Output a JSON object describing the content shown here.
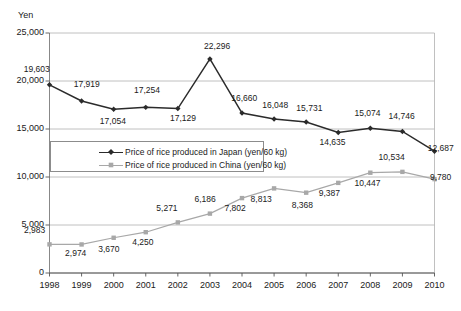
{
  "chart_data": {
    "type": "line",
    "title": "",
    "xlabel": "",
    "ylabel": "Yen",
    "ylim": [
      0,
      25000
    ],
    "ytick_labels": [
      "25,000",
      "20,000",
      "15,000",
      "10,000",
      "5,000",
      "0"
    ],
    "ytick_values": [
      25000,
      20000,
      15000,
      10000,
      5000,
      0
    ],
    "grid": true,
    "legend_position": "inside-upper-left",
    "categories": [
      "1998",
      "1999",
      "2000",
      "2001",
      "2002",
      "2003",
      "2004",
      "2005",
      "2006",
      "2007",
      "2008",
      "2009",
      "2010"
    ],
    "x": [
      1998,
      1999,
      2000,
      2001,
      2002,
      2003,
      2004,
      2005,
      2006,
      2007,
      2008,
      2009,
      2010
    ],
    "series": [
      {
        "name": "Price of rice produced in Japan (yen/60 kg)",
        "color": "#2b2b2b",
        "marker": "filled-diamond",
        "values": [
          19603,
          17919,
          17054,
          17254,
          17129,
          22296,
          16660,
          16048,
          15731,
          14635,
          15074,
          14746,
          12687
        ],
        "labels": [
          "19,603",
          "17,919",
          "17,054",
          "17,254",
          "17,129",
          "22,296",
          "16,660",
          "16,048",
          "15,731",
          "14,635",
          "15,074",
          "14,746",
          "12,687"
        ]
      },
      {
        "name": "Price of rice produced in China (yen/60 kg)",
        "color": "#a8a8a8",
        "marker": "filled-square",
        "values": [
          2983,
          2974,
          3670,
          4250,
          5271,
          6186,
          7802,
          8813,
          8368,
          9387,
          10447,
          10534,
          9780
        ],
        "labels": [
          "2,983",
          "2,974",
          "3,670",
          "4,250",
          "5,271",
          "6,186",
          "7,802",
          "8,813",
          "8,368",
          "9,387",
          "10,447",
          "10,534",
          "9,780"
        ]
      }
    ],
    "label_offsets": {
      "japan": [
        {
          "dx": -12,
          "dy": -16
        },
        {
          "dx": 6,
          "dy": -17
        },
        {
          "dx": 0,
          "dy": 12
        },
        {
          "dx": 2,
          "dy": -17
        },
        {
          "dx": 6,
          "dy": 9
        },
        {
          "dx": 8,
          "dy": -13
        },
        {
          "dx": 3,
          "dy": -15
        },
        {
          "dx": 2,
          "dy": -14
        },
        {
          "dx": 4,
          "dy": -14
        },
        {
          "dx": -5,
          "dy": 9
        },
        {
          "dx": -2,
          "dy": -15
        },
        {
          "dx": 0,
          "dy": -15
        },
        {
          "dx": 7,
          "dy": -3
        }
      ],
      "china": [
        {
          "dx": -14,
          "dy": -14
        },
        {
          "dx": -5,
          "dy": 9
        },
        {
          "dx": -4,
          "dy": 11
        },
        {
          "dx": -2,
          "dy": 10
        },
        {
          "dx": -10,
          "dy": -14
        },
        {
          "dx": -4,
          "dy": -15
        },
        {
          "dx": -6,
          "dy": 10
        },
        {
          "dx": -12,
          "dy": 11
        },
        {
          "dx": -3,
          "dy": 12
        },
        {
          "dx": -8,
          "dy": 10
        },
        {
          "dx": -2,
          "dy": 10
        },
        {
          "dx": -10,
          "dy": -15
        },
        {
          "dx": 7,
          "dy": -2
        }
      ]
    }
  },
  "axes": {
    "unit_label": "Yen"
  },
  "legend": {
    "items": [
      {
        "label": "Price of rice produced in Japan (yen/60 kg)",
        "color": "#2b2b2b"
      },
      {
        "label": "Price of rice produced in China (yen/60 kg)",
        "color": "#a8a8a8"
      }
    ]
  }
}
